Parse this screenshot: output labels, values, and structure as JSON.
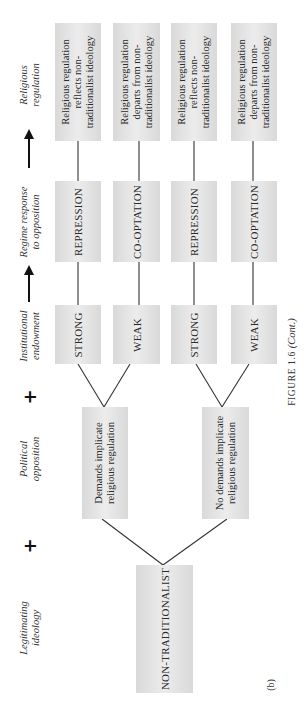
{
  "figure": {
    "caption_label": "FIGURE 1.6",
    "caption_suffix": "(Cont.)",
    "panel": "(b)"
  },
  "axis_labels": {
    "religious_regulation": [
      "Religious",
      "regulation"
    ],
    "regime_response": [
      "Regime response",
      "to opposition"
    ],
    "institutional_endowment": [
      "Institutional",
      "endowment"
    ],
    "political_opposition": [
      "Political",
      "opposition"
    ],
    "legitimating_ideology": [
      "Legitimating",
      "ideology"
    ],
    "plus_symbol": "+"
  },
  "ideology": {
    "label": "NON-TRADITIONALIST"
  },
  "opposition": [
    {
      "line1": "Demands implicate",
      "line2": "religious regulation"
    },
    {
      "line1": "No demands implicate",
      "line2": "religious regulation"
    }
  ],
  "endowment": [
    {
      "label": "STRONG"
    },
    {
      "label": "WEAK"
    },
    {
      "label": "STRONG"
    },
    {
      "label": "WEAK"
    }
  ],
  "response": [
    {
      "label": "REPRESSION"
    },
    {
      "label": "CO-OPTATION"
    },
    {
      "label": "REPRESSION"
    },
    {
      "label": "CO-OPTATION"
    }
  ],
  "regulation": [
    {
      "line1": "Religious regulation",
      "line2": "reflects non-",
      "line3": "traditionalist ideology"
    },
    {
      "line1": "Religious regulation",
      "line2": "departs from non-",
      "line3": "traditionalist ideology"
    },
    {
      "line1": "Religious regulation",
      "line2": "reflects non-",
      "line3": "traditionalist ideology"
    },
    {
      "line1": "Religious regulation",
      "line2": "departs from non-",
      "line3": "traditionalist ideology"
    }
  ]
}
